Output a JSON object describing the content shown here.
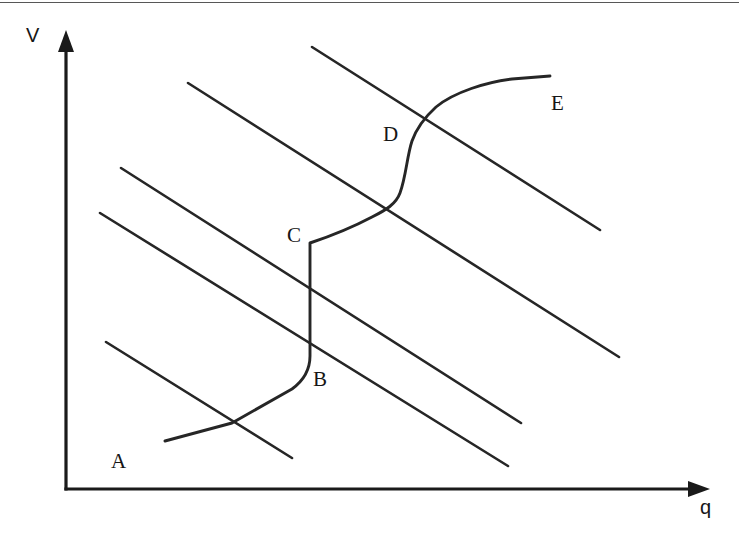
{
  "figure": {
    "background_color": "#ffffff",
    "ink_color": "#262626",
    "axis_color": "#1a1a1a",
    "width": 739,
    "height": 539
  },
  "axes": {
    "y_axis_label": "V",
    "x_axis_label": "q",
    "origin": {
      "x": 66,
      "y": 489
    },
    "y_axis_top": {
      "x": 66,
      "y": 38
    },
    "x_axis_right": {
      "x": 706,
      "y": 489
    }
  },
  "labels": {
    "a": "A",
    "b": "B",
    "c": "C",
    "d": "D",
    "e": "E"
  },
  "chart_data": {
    "type": "line",
    "title": "",
    "xlabel": "q",
    "ylabel": "V",
    "xlim": [
      0,
      739
    ],
    "ylim": [
      0,
      539
    ],
    "grid": false,
    "legend": "none",
    "annotations": [
      {
        "text": "A",
        "x": 118,
        "y": 461
      },
      {
        "text": "B",
        "x": 319,
        "y": 379
      },
      {
        "text": "C",
        "x": 294,
        "y": 235
      },
      {
        "text": "D",
        "x": 390,
        "y": 134
      },
      {
        "text": "E",
        "x": 557,
        "y": 103
      }
    ],
    "series": [
      {
        "name": "demand-curve-1",
        "kind": "line",
        "points": [
          [
            106,
            342
          ],
          [
            292,
            458
          ]
        ]
      },
      {
        "name": "demand-curve-2",
        "kind": "line",
        "points": [
          [
            100,
            213
          ],
          [
            508,
            466
          ]
        ]
      },
      {
        "name": "demand-curve-3",
        "kind": "line",
        "points": [
          [
            121,
            168
          ],
          [
            521,
            423
          ]
        ]
      },
      {
        "name": "demand-curve-4",
        "kind": "line",
        "points": [
          [
            188,
            83
          ],
          [
            619,
            357
          ]
        ]
      },
      {
        "name": "demand-curve-5",
        "kind": "line",
        "points": [
          [
            312,
            47
          ],
          [
            600,
            230
          ]
        ]
      },
      {
        "name": "supply-curve",
        "kind": "step-curve",
        "points": [
          [
            165,
            441
          ],
          [
            230,
            424
          ],
          [
            291,
            390
          ],
          [
            310,
            355
          ],
          [
            310,
            243
          ],
          [
            352,
            224
          ],
          [
            381,
            211
          ],
          [
            398,
            196
          ],
          [
            408,
            170
          ],
          [
            414,
            140
          ],
          [
            425,
            120
          ],
          [
            446,
            100
          ],
          [
            478,
            87
          ],
          [
            512,
            80
          ],
          [
            550,
            76
          ]
        ]
      }
    ]
  }
}
